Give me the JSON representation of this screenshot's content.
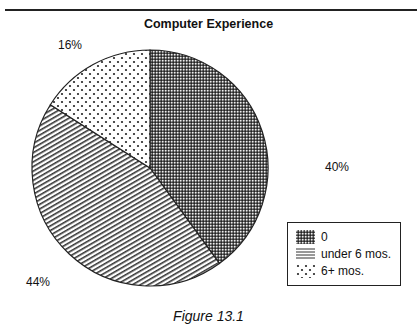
{
  "chart_data": {
    "type": "pie",
    "title": "Computer Experience",
    "caption": "Figure 13.1",
    "start_angle": "top, clockwise",
    "slices": [
      {
        "label": "0",
        "value": 40,
        "display": "40%",
        "pattern": "crosshatch"
      },
      {
        "label": "under 6 mos.",
        "value": 44,
        "display": "44%",
        "pattern": "lines"
      },
      {
        "label": "6+ mos.",
        "value": 16,
        "display": "16%",
        "pattern": "dots"
      }
    ],
    "legend": {
      "placement": "bottom-right",
      "entries": [
        "0",
        "under 6 mos.",
        "6+ mos."
      ]
    }
  },
  "colors": {
    "ink": "#222222",
    "background": "#ffffff"
  }
}
